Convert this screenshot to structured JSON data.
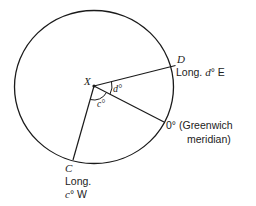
{
  "diagram": {
    "circle": {
      "cx": 94,
      "cy": 87,
      "rx": 79.5,
      "ry": 76.5
    },
    "center": {
      "label": "X",
      "x": 94,
      "y": 86
    },
    "points": {
      "D": {
        "label": "D",
        "x": 176,
        "y": 65,
        "line1": "Long. ",
        "var": "d",
        "deg": "°",
        "dir": " E"
      },
      "G": {
        "label": "0°",
        "x": 164,
        "y": 122,
        "line1": " (Greenwich",
        "line2": "meridian)"
      },
      "C": {
        "label": "C",
        "x": 73,
        "y": 160,
        "line1": "Long.",
        "var": "c",
        "deg": "°",
        "dir": " W"
      }
    },
    "angles": {
      "d": {
        "label": "d°"
      },
      "c": {
        "label": "c°"
      }
    },
    "colors": {
      "stroke": "#1a1a1a",
      "text": "#222222",
      "background": "#ffffff"
    }
  }
}
